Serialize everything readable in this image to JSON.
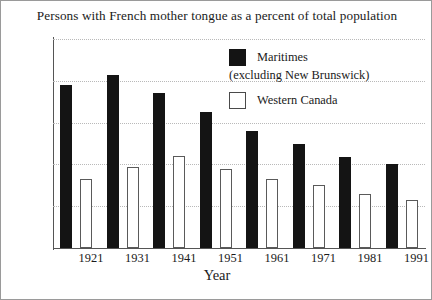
{
  "chart_data": {
    "type": "bar",
    "title": "Persons with French mother tongue as a percent of total population",
    "xlabel": "Year",
    "ylabel": "",
    "categories": [
      "1921",
      "1931",
      "1941",
      "1951",
      "1961",
      "1971",
      "1981",
      "1991"
    ],
    "series": [
      {
        "name": "Maritimes (excluding New Brunswick)",
        "color": "#141414",
        "values": [
          7.8,
          8.3,
          7.4,
          6.5,
          5.6,
          5.0,
          4.35,
          4.0
        ]
      },
      {
        "name": "Western Canada",
        "color": "#ffffff",
        "values": [
          3.3,
          3.9,
          4.4,
          3.8,
          3.3,
          3.0,
          2.6,
          2.3
        ]
      }
    ],
    "ylim": [
      0,
      10
    ],
    "yticks": [
      {
        "value": 10,
        "label": "10%"
      },
      {
        "value": 8,
        "label": "8"
      },
      {
        "value": 6,
        "label": "6"
      },
      {
        "value": 4,
        "label": "4"
      },
      {
        "value": 2,
        "label": "2"
      },
      {
        "value": 0,
        "label": "0"
      }
    ],
    "grid": true,
    "legend_position": "top-right",
    "legend": [
      {
        "label_line1": "Maritimes",
        "label_line2": "(excluding New Brunswick)",
        "swatch": "dark"
      },
      {
        "label_line1": "Western Canada",
        "label_line2": "",
        "swatch": "light"
      }
    ]
  }
}
